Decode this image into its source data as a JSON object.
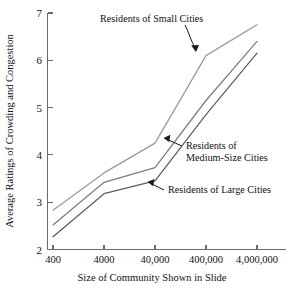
{
  "chart_data": {
    "type": "line",
    "title": "",
    "xlabel": "Size of Community Shown in Slide",
    "ylabel": "Average Ratings of Crowding and Congestion",
    "categories": [
      "400",
      "4000",
      "40,000",
      "400,000",
      "4,000,000"
    ],
    "x_tick_labels": [
      "400",
      "4000",
      "40,000",
      "400,000",
      "4,000,000"
    ],
    "y_tick_labels": [
      "2",
      "3",
      "4",
      "5",
      "6",
      "7"
    ],
    "ylim": [
      2,
      7
    ],
    "grid": false,
    "legend_position": "inline-annotations",
    "series": [
      {
        "name": "Residents of Small Cities",
        "values": [
          2.83,
          3.62,
          4.25,
          6.1,
          6.75
        ],
        "color": "#9a9a9a"
      },
      {
        "name": "Residents of Medium-Size Cities",
        "values": [
          2.52,
          3.42,
          3.73,
          5.15,
          6.4
        ],
        "color": "#7d7d7d"
      },
      {
        "name": "Residents of Large Cities",
        "values": [
          2.27,
          3.18,
          3.45,
          4.85,
          6.15
        ],
        "color": "#5e5e5e"
      }
    ],
    "annotations": [
      {
        "text": "Residents of Small Cities",
        "target_series": "Residents of Small Cities"
      },
      {
        "text_line1": "Residents of",
        "text_line2": "Medium-Size Cities",
        "target_series": "Residents of Medium-Size Cities"
      },
      {
        "text": "Residents of Large Cities",
        "target_series": "Residents of Large Cities"
      }
    ]
  },
  "axes": {
    "y_title": "Average Ratings of Crowding and Congestion",
    "x_title": "Size of Community Shown in Slide",
    "y_ticks": [
      "7",
      "6",
      "5",
      "4",
      "3",
      "2"
    ],
    "x_ticks": [
      "400",
      "4000",
      "40,000",
      "400,000",
      "4,000,000"
    ]
  },
  "annotations": {
    "small_cities": "Residents of Small Cities",
    "medium_cities_line1": "Residents of",
    "medium_cities_line2": "Medium-Size Cities",
    "large_cities": "Residents of Large Cities"
  },
  "colors": {
    "small_cities_line": "#9a9a9a",
    "medium_cities_line": "#7d7d7d",
    "large_cities_line": "#5e5e5e",
    "axis": "#6b6b6b",
    "text": "#111111",
    "background": "#ffffff"
  }
}
